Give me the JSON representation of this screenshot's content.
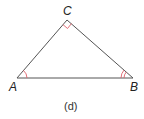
{
  "diagram": {
    "type": "triangle",
    "vertices": {
      "A": {
        "label": "A",
        "x": 17,
        "y": 78
      },
      "B": {
        "label": "B",
        "x": 133,
        "y": 78
      },
      "C": {
        "label": "C",
        "x": 67,
        "y": 20
      }
    },
    "angle_marks": {
      "A": "single-arc",
      "B": "double-arc",
      "C": "right-angle"
    },
    "caption": "(d)",
    "colors": {
      "lines": "#555555",
      "angle_marks": "#e0606a"
    }
  }
}
